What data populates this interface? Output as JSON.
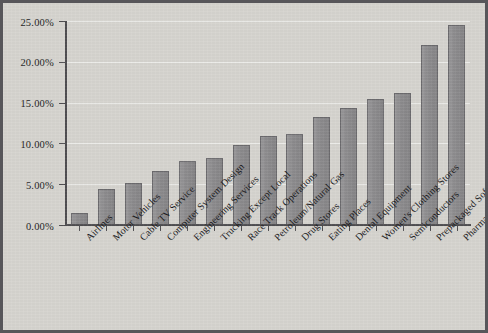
{
  "chart_data": {
    "type": "bar",
    "title": "",
    "subtitle": "",
    "xlabel": "",
    "ylabel": "",
    "ylim": [
      0,
      25
    ],
    "ytick_labels": [
      "25.00%",
      "20.00%",
      "15.00%",
      "10.00%",
      "5.00%",
      "0.00%"
    ],
    "ytick_values": [
      25,
      20,
      15,
      10,
      5,
      0
    ],
    "grid": "horizontal",
    "legend": "none",
    "value_suffix": "%",
    "categories": [
      "Airlines",
      "Motor Vehicles",
      "Cable TV Service",
      "Computer System Design",
      "Engineering Services",
      "Trucking Except Local",
      "Race Track Operations",
      "Petroleum/Natural Gas",
      "Drug Stores",
      "Eating Places",
      "Dental Equipment",
      "Women's Clothing Stores",
      "Semiconductors",
      "Prepackaged Software",
      "Pharmaceuticals"
    ],
    "values": [
      1.5,
      4.4,
      5.2,
      6.6,
      7.8,
      8.2,
      9.8,
      10.9,
      11.1,
      13.2,
      14.4,
      15.4,
      16.2,
      22.0,
      24.5
    ]
  },
  "style": {
    "bar_fill": "#8d8c8e",
    "bar_border": "#6b6a6d",
    "plot_background": "#d6d4cf",
    "frame_border": "#57565a",
    "axis_color": "#4e4d50",
    "text_color": "#17171a",
    "gridline_color": "#ffffff"
  }
}
